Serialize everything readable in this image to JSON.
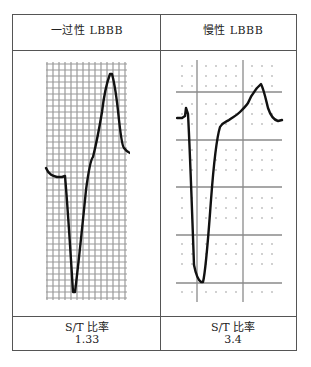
{
  "table": {
    "columns": [
      {
        "header": "一过性 LBBB",
        "ratio_label": "S/T 比率",
        "ratio_value": "1.33"
      },
      {
        "header": "慢性 LBBB",
        "ratio_label": "S/T 比率",
        "ratio_value": "3.4"
      }
    ]
  },
  "colors": {
    "border": "#555555",
    "trace": "#111111",
    "grid_fine": "#9a9a9a",
    "grid_major": "#8a8a8a",
    "dots": "#bbbbbb"
  }
}
